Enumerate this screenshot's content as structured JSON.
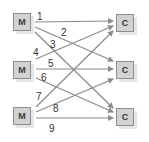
{
  "diagram": {
    "sources": [
      {
        "id": "M1",
        "label": "M",
        "x": 13,
        "y": 13
      },
      {
        "id": "M2",
        "label": "M",
        "x": 13,
        "y": 61
      },
      {
        "id": "M3",
        "label": "M",
        "x": 13,
        "y": 107
      }
    ],
    "targets": [
      {
        "id": "C1",
        "label": "C",
        "x": 116,
        "y": 14
      },
      {
        "id": "C2",
        "label": "C",
        "x": 116,
        "y": 61
      },
      {
        "id": "C3",
        "label": "C",
        "x": 116,
        "y": 108
      }
    ],
    "edges": [
      {
        "label": "1",
        "from": "M1",
        "to": "C1",
        "x1": 35,
        "y1": 22,
        "x2": 113,
        "y2": 21,
        "lx": 37,
        "ly": 12
      },
      {
        "label": "2",
        "from": "M1",
        "to": "C2",
        "x1": 35,
        "y1": 27,
        "x2": 113,
        "y2": 61,
        "lx": 61,
        "ly": 28
      },
      {
        "label": "3",
        "from": "M1",
        "to": "C3",
        "x1": 35,
        "y1": 32,
        "x2": 113,
        "y2": 108,
        "lx": 50,
        "ly": 40
      },
      {
        "label": "4",
        "from": "M2",
        "to": "C1",
        "x1": 36,
        "y1": 59,
        "x2": 113,
        "y2": 26,
        "lx": 33,
        "ly": 48
      },
      {
        "label": "5",
        "from": "M2",
        "to": "C2",
        "x1": 36,
        "y1": 69,
        "x2": 113,
        "y2": 69,
        "lx": 48,
        "ly": 59
      },
      {
        "label": "6",
        "from": "M2",
        "to": "C3",
        "x1": 36,
        "y1": 78,
        "x2": 113,
        "y2": 112,
        "lx": 41,
        "ly": 73
      },
      {
        "label": "7",
        "from": "M3",
        "to": "C1",
        "x1": 36,
        "y1": 107,
        "x2": 113,
        "y2": 31,
        "lx": 36,
        "ly": 92
      },
      {
        "label": "8",
        "from": "M3",
        "to": "C2",
        "x1": 36,
        "y1": 112,
        "x2": 113,
        "y2": 79,
        "lx": 53,
        "ly": 104
      },
      {
        "label": "9",
        "from": "M3",
        "to": "C3",
        "x1": 36,
        "y1": 118,
        "x2": 113,
        "y2": 118,
        "lx": 49,
        "ly": 124
      }
    ],
    "colors": {
      "node_fill": "#d2d2d2",
      "node_border": "#8e8e8e",
      "edge": "#8a8a8a",
      "text": "#333333"
    }
  }
}
